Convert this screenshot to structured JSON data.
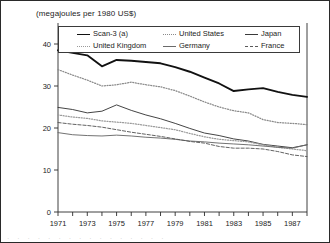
{
  "chart_data": {
    "type": "line",
    "title": "(megajoules per 1980 US$)",
    "xlabel": "",
    "ylabel": "",
    "ylim": [
      0,
      45
    ],
    "yticks": [
      0,
      10,
      20,
      30,
      40
    ],
    "ytick_labels": [
      "0",
      "10",
      "20",
      "30",
      "40"
    ],
    "xlim": [
      1971,
      1988
    ],
    "x": [
      1971,
      1972,
      1973,
      1974,
      1975,
      1976,
      1977,
      1978,
      1979,
      1980,
      1981,
      1982,
      1983,
      1984,
      1985,
      1986,
      1987,
      1988
    ],
    "xticks": [
      1971,
      1972,
      1973,
      1974,
      1975,
      1976,
      1977,
      1978,
      1979,
      1980,
      1981,
      1982,
      1983,
      1984,
      1985,
      1986,
      1987,
      1988
    ],
    "xtick_labels": [
      "1971",
      "",
      "1973",
      "",
      "1975",
      "",
      "1977",
      "",
      "1979",
      "",
      "1981",
      "",
      "1983",
      "",
      "1985",
      "",
      "1987",
      ""
    ],
    "grid": false,
    "legend_position": "top-inside",
    "series": [
      {
        "name": "Scan-3 (a)",
        "style": "solid-thick",
        "color": "#111111",
        "values": [
          38.5,
          37.9,
          37.3,
          34.7,
          36.2,
          36.0,
          35.7,
          35.4,
          34.5,
          33.4,
          32.0,
          30.6,
          28.8,
          29.2,
          29.5,
          28.6,
          27.9,
          27.4
        ]
      },
      {
        "name": "United States",
        "style": "dotted",
        "color": "#8a8a8a",
        "values": [
          33.9,
          32.6,
          31.4,
          30.0,
          30.3,
          30.9,
          30.3,
          29.8,
          28.9,
          27.6,
          26.2,
          25.0,
          24.1,
          23.6,
          22.0,
          21.3,
          21.1,
          20.8
        ]
      },
      {
        "name": "Japan",
        "style": "solid",
        "color": "#3a3a3a",
        "values": [
          24.9,
          24.4,
          23.6,
          24.0,
          25.5,
          24.2,
          23.1,
          22.2,
          21.1,
          19.9,
          18.8,
          18.2,
          17.4,
          16.9,
          16.1,
          15.7,
          15.3,
          16.0
        ]
      },
      {
        "name": "United Kingdom",
        "style": "dotted",
        "color": "#9a9a9a",
        "values": [
          23.1,
          22.6,
          22.3,
          21.7,
          21.4,
          21.1,
          20.6,
          20.1,
          19.6,
          18.7,
          17.9,
          17.3,
          17.0,
          16.7,
          16.0,
          15.4,
          15.0,
          14.6
        ]
      },
      {
        "name": "Germany",
        "style": "solid",
        "color": "#6a6a6a",
        "values": [
          18.9,
          18.4,
          18.2,
          18.1,
          18.3,
          18.1,
          17.8,
          17.6,
          17.3,
          16.9,
          16.7,
          16.4,
          16.2,
          16.0,
          15.7,
          15.4,
          15.2,
          16.0
        ]
      },
      {
        "name": "France",
        "style": "dashed",
        "color": "#5a5a5a",
        "values": [
          21.3,
          20.9,
          20.6,
          20.2,
          19.6,
          19.0,
          18.5,
          18.0,
          17.4,
          16.8,
          16.4,
          15.6,
          15.2,
          15.2,
          15.0,
          14.4,
          13.6,
          13.2
        ]
      }
    ]
  },
  "legend": {
    "row1": [
      {
        "label": "Scan-3 (a)",
        "style": "solid-thick"
      },
      {
        "label": "United States",
        "style": "dotted"
      },
      {
        "label": "Japan",
        "style": "solid"
      }
    ],
    "row2": [
      {
        "label": "United Kingdom",
        "style": "dotted"
      },
      {
        "label": "Germany",
        "style": "solid"
      },
      {
        "label": "France",
        "style": "dashed"
      }
    ]
  },
  "footer": {
    "partial_text": "· · · · · · · · · · · · · · · ·"
  }
}
